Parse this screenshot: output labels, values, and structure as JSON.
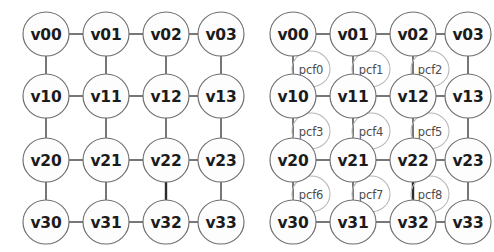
{
  "figure": {
    "background_color": "#ffffff",
    "node_stroke_color": "#6e6e6e",
    "pcf_stroke_color": "#b7b7b7",
    "edge_color": "#4a4a4a",
    "label_color": "#1b1b1b",
    "pcf_label_color": "#4c4c4c"
  },
  "panels": [
    {
      "id": "left",
      "name": "variable-grid-graph",
      "nodes": [
        {
          "id": "v00",
          "label": "v00",
          "row": 0,
          "col": 0
        },
        {
          "id": "v01",
          "label": "v01",
          "row": 0,
          "col": 1
        },
        {
          "id": "v02",
          "label": "v02",
          "row": 0,
          "col": 2
        },
        {
          "id": "v03",
          "label": "v03",
          "row": 0,
          "col": 3
        },
        {
          "id": "v10",
          "label": "v10",
          "row": 1,
          "col": 0
        },
        {
          "id": "v11",
          "label": "v11",
          "row": 1,
          "col": 1
        },
        {
          "id": "v12",
          "label": "v12",
          "row": 1,
          "col": 2
        },
        {
          "id": "v13",
          "label": "v13",
          "row": 1,
          "col": 3
        },
        {
          "id": "v20",
          "label": "v20",
          "row": 2,
          "col": 0
        },
        {
          "id": "v21",
          "label": "v21",
          "row": 2,
          "col": 1
        },
        {
          "id": "v22",
          "label": "v22",
          "row": 2,
          "col": 2
        },
        {
          "id": "v23",
          "label": "v23",
          "row": 2,
          "col": 3
        },
        {
          "id": "v30",
          "label": "v30",
          "row": 3,
          "col": 0
        },
        {
          "id": "v31",
          "label": "v31",
          "row": 3,
          "col": 1
        },
        {
          "id": "v32",
          "label": "v32",
          "row": 3,
          "col": 2
        },
        {
          "id": "v33",
          "label": "v33",
          "row": 3,
          "col": 3
        }
      ],
      "factor_nodes": []
    },
    {
      "id": "right",
      "name": "factor-graph-with-pcf-nodes",
      "nodes": [
        {
          "id": "v00",
          "label": "v00",
          "row": 0,
          "col": 0
        },
        {
          "id": "v01",
          "label": "v01",
          "row": 0,
          "col": 1
        },
        {
          "id": "v02",
          "label": "v02",
          "row": 0,
          "col": 2
        },
        {
          "id": "v03",
          "label": "v03",
          "row": 0,
          "col": 3
        },
        {
          "id": "v10",
          "label": "v10",
          "row": 1,
          "col": 0
        },
        {
          "id": "v11",
          "label": "v11",
          "row": 1,
          "col": 1
        },
        {
          "id": "v12",
          "label": "v12",
          "row": 1,
          "col": 2
        },
        {
          "id": "v13",
          "label": "v13",
          "row": 1,
          "col": 3
        },
        {
          "id": "v20",
          "label": "v20",
          "row": 2,
          "col": 0
        },
        {
          "id": "v21",
          "label": "v21",
          "row": 2,
          "col": 1
        },
        {
          "id": "v22",
          "label": "v22",
          "row": 2,
          "col": 2
        },
        {
          "id": "v23",
          "label": "v23",
          "row": 2,
          "col": 3
        },
        {
          "id": "v30",
          "label": "v30",
          "row": 3,
          "col": 0
        },
        {
          "id": "v31",
          "label": "v31",
          "row": 3,
          "col": 1
        },
        {
          "id": "v32",
          "label": "v32",
          "row": 3,
          "col": 2
        },
        {
          "id": "v33",
          "label": "v33",
          "row": 3,
          "col": 3
        }
      ],
      "factor_nodes": [
        {
          "id": "pcf0",
          "label": "pcf0",
          "band": 0,
          "slot": 0
        },
        {
          "id": "pcf1",
          "label": "pcf1",
          "band": 0,
          "slot": 1
        },
        {
          "id": "pcf2",
          "label": "pcf2",
          "band": 0,
          "slot": 2
        },
        {
          "id": "pcf3",
          "label": "pcf3",
          "band": 1,
          "slot": 0
        },
        {
          "id": "pcf4",
          "label": "pcf4",
          "band": 1,
          "slot": 1
        },
        {
          "id": "pcf5",
          "label": "pcf5",
          "band": 1,
          "slot": 2
        },
        {
          "id": "pcf6",
          "label": "pcf6",
          "band": 2,
          "slot": 0
        },
        {
          "id": "pcf7",
          "label": "pcf7",
          "band": 2,
          "slot": 1
        },
        {
          "id": "pcf8",
          "label": "pcf8",
          "band": 2,
          "slot": 2
        }
      ]
    }
  ],
  "geometry": {
    "col_x": [
      46,
      106,
      166,
      221
    ],
    "row_y": [
      34,
      96,
      160,
      222
    ],
    "node_rx": 23,
    "node_ry": 22,
    "pcf_rx": 19,
    "pcf_ry": 18,
    "pcf_col_x": [
      64,
      124,
      183
    ],
    "pcf_row_y": [
      69,
      131,
      194
    ]
  },
  "edges": {
    "horizontal_rows": [
      0,
      1,
      2,
      3
    ],
    "vertical_cols": [
      0,
      1,
      2,
      3
    ],
    "bold_edge": {
      "from": "v22",
      "to": "v32"
    }
  }
}
